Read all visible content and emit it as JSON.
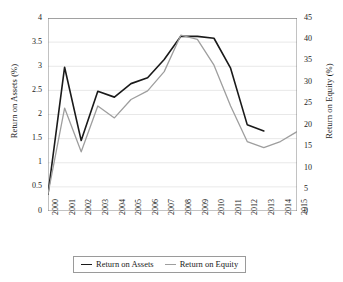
{
  "chart_data": {
    "type": "line",
    "title": "",
    "xlabel": "",
    "ylabel": "Return on Assets (%)",
    "y2label": "Return on Equity (%)",
    "grid": true,
    "legend_position": "bottom",
    "categories": [
      "2000",
      "2001",
      "2002",
      "2003",
      "2004",
      "2005",
      "2006",
      "2007",
      "2008",
      "2009",
      "2010",
      "2011",
      "2012",
      "2013",
      "2014",
      "2015"
    ],
    "ylim": [
      0,
      4
    ],
    "yticks": [
      "0",
      "0.5",
      "1",
      "1.5",
      "2",
      "2.5",
      "3",
      "3.5",
      "4"
    ],
    "y2lim": [
      0,
      45
    ],
    "y2ticks": [
      "0",
      "5",
      "10",
      "15",
      "20",
      "25",
      "30",
      "35",
      "40",
      "45"
    ],
    "series": [
      {
        "name": "Return on Assets",
        "axis": "left",
        "color": "#1a1a1a",
        "values": [
          0.35,
          2.98,
          1.46,
          2.48,
          2.36,
          2.64,
          2.76,
          3.14,
          3.62,
          3.62,
          3.58,
          2.96,
          1.79,
          1.66,
          null,
          null
        ]
      },
      {
        "name": "Return on Equity",
        "axis": "right",
        "color": "#9e9e9e",
        "values": [
          4.0,
          24.0,
          13.8,
          24.5,
          21.7,
          26.0,
          28.0,
          32.5,
          41.0,
          40.0,
          34.0,
          24.5,
          16.2,
          14.8,
          16.2,
          18.5
        ]
      }
    ]
  },
  "legend": {
    "items": [
      {
        "label": "Return on Assets",
        "color": "#1a1a1a"
      },
      {
        "label": "Return on Equity",
        "color": "#9e9e9e"
      }
    ]
  }
}
